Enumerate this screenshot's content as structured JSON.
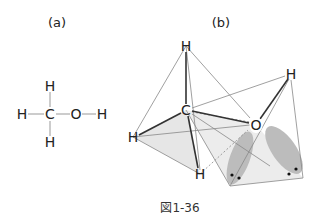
{
  "panels": {
    "a": {
      "label": "(a)"
    },
    "b": {
      "label": "(b)"
    }
  },
  "structural_formula": {
    "atoms": [
      {
        "symbol": "H",
        "x": 50,
        "y": 86
      },
      {
        "symbol": "H",
        "x": 22,
        "y": 114
      },
      {
        "symbol": "C",
        "x": 50,
        "y": 114
      },
      {
        "symbol": "O",
        "x": 76,
        "y": 114
      },
      {
        "symbol": "H",
        "x": 102,
        "y": 114
      },
      {
        "symbol": "H",
        "x": 50,
        "y": 142
      }
    ]
  },
  "model_3d": {
    "atoms": [
      {
        "symbol": "H",
        "x": 186,
        "y": 46
      },
      {
        "symbol": "C",
        "x": 186,
        "y": 110
      },
      {
        "symbol": "H",
        "x": 133,
        "y": 137
      },
      {
        "symbol": "H",
        "x": 200,
        "y": 174
      },
      {
        "symbol": "O",
        "x": 256,
        "y": 125
      },
      {
        "symbol": "H",
        "x": 291,
        "y": 74
      }
    ]
  },
  "caption": "図1-36"
}
